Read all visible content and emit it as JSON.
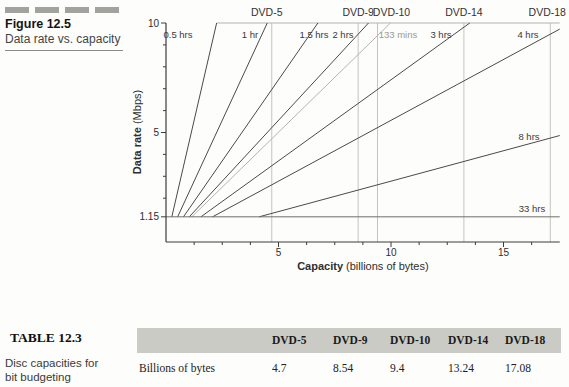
{
  "figure": {
    "title": "Figure 12.5",
    "subtitle": "Data rate vs. capacity"
  },
  "colors": {
    "dark_line": "#4a4a4a",
    "gray_line": "#b3b3b0",
    "dvd_line": "#c4c4bf",
    "baseline_line": "#6e6e6e",
    "axis": "#3c3c3c",
    "text": "#2e2e2e",
    "gray_text": "#9a9a97",
    "table_band": "#cbcbc5",
    "caption_bars": "#a3a39d"
  },
  "chart_data": {
    "type": "line",
    "title": "Data rate vs. capacity",
    "xlabel": "Capacity (billions of bytes)",
    "xlabel_bold": "Capacity",
    "xlabel_rest": " (billions of bytes)",
    "ylabel": "Data rate (Mbps)",
    "ylabel_bold": "Data rate",
    "ylabel_rest": " (Mbps)",
    "xlim": [
      0,
      17.5
    ],
    "ylim": [
      0,
      10
    ],
    "x_major_ticks": [
      5,
      10,
      15
    ],
    "x_minor_step": 1.25,
    "y_labeled_ticks": [
      10,
      5,
      1.15
    ],
    "y_minor_step": 1,
    "baseline_rate": 1.15,
    "grid": "off",
    "series": [
      {
        "name": "0.5 hrs",
        "hours": 0.5,
        "style": "dark"
      },
      {
        "name": "1 hr",
        "hours": 1,
        "style": "dark"
      },
      {
        "name": "1.5 hrs",
        "hours": 1.5,
        "style": "dark"
      },
      {
        "name": "2 hrs",
        "hours": 2,
        "style": "dark"
      },
      {
        "name": "133 mins",
        "hours": 2.2167,
        "style": "gray"
      },
      {
        "name": "3 hrs",
        "hours": 3,
        "style": "dark"
      },
      {
        "name": "4 hrs",
        "hours": 4,
        "style": "dark"
      },
      {
        "name": "8 hrs",
        "hours": 8,
        "style": "dark"
      },
      {
        "name": "33 hrs",
        "hours": 33,
        "style": "dark"
      }
    ],
    "vertical_markers": [
      {
        "name": "DVD-5",
        "billions_of_bytes": 4.7
      },
      {
        "name": "DVD-9",
        "billions_of_bytes": 8.54
      },
      {
        "name": "DVD-10",
        "billions_of_bytes": 9.4
      },
      {
        "name": "DVD-14",
        "billions_of_bytes": 13.24
      },
      {
        "name": "DVD-18",
        "billions_of_bytes": 17.08
      }
    ]
  },
  "table": {
    "label": "TABLE 12.3",
    "caption_line1": "Disc capacities for",
    "caption_line2": "bit budgeting",
    "columns": [
      "DVD-5",
      "DVD-9",
      "DVD-10",
      "DVD-14",
      "DVD-18"
    ],
    "rows": [
      {
        "name": "Billions of bytes",
        "values": [
          "4.7",
          "8.54",
          "9.4",
          "13.24",
          "17.08"
        ]
      }
    ]
  }
}
